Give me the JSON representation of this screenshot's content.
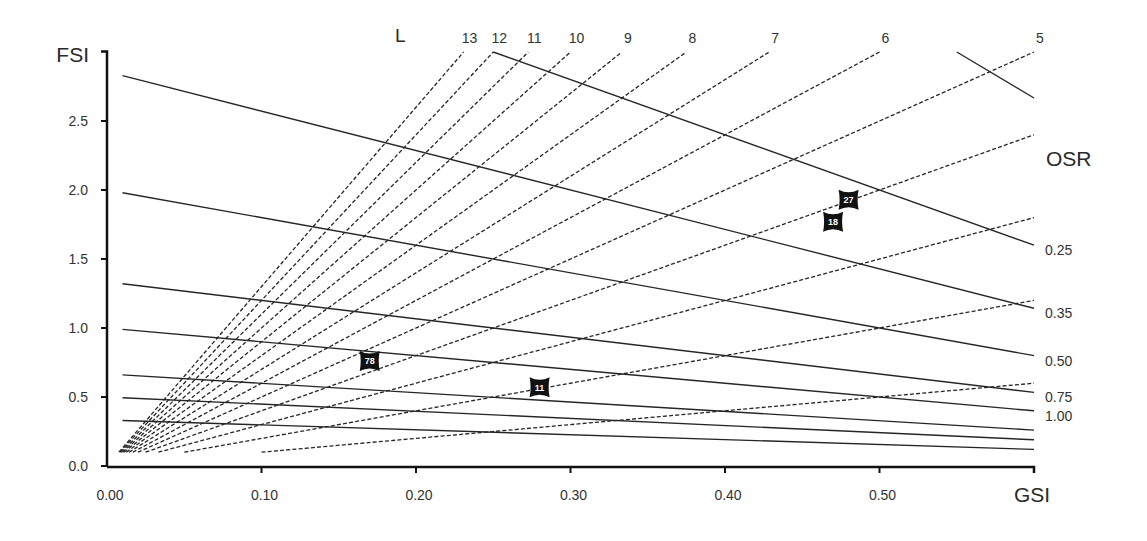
{
  "colors": {
    "background": "#ffffff",
    "line": "#262626",
    "axis": "#111111",
    "text": "#333333",
    "marker": "#111111",
    "marker_text": "#ffffff"
  },
  "chart_data": {
    "type": "line",
    "title": "",
    "xlabel": "GSI",
    "ylabel": "FSI",
    "xlim": [
      0,
      0.6
    ],
    "ylim": [
      0,
      3.0
    ],
    "grid": false,
    "legend": "none (lines labeled directly: L at top, OSR at right)",
    "x_ticks": [
      0,
      0.1,
      0.2,
      0.3,
      0.4,
      0.5
    ],
    "x_tick_labels": [
      "0.00",
      "0.10",
      "0.20",
      "0.30",
      "0.40",
      "0.50"
    ],
    "y_ticks": [
      0,
      0.5,
      1.0,
      1.5,
      2.0,
      2.5
    ],
    "y_tick_labels": [
      "0.0",
      "0.5",
      "1.0",
      "1.5",
      "2.0",
      "2.5"
    ],
    "layer_lines": {
      "title": "L",
      "style": "dashed",
      "series": [
        {
          "name": "L=1",
          "label": "",
          "points": [
            [
              0.1,
              0.1
            ],
            [
              0.6,
              0.6
            ]
          ]
        },
        {
          "name": "L=2",
          "label": "",
          "points": [
            [
              0.05,
              0.1
            ],
            [
              0.6,
              1.2
            ]
          ]
        },
        {
          "name": "L=3",
          "label": "",
          "points": [
            [
              0.0333,
              0.1
            ],
            [
              0.6,
              1.8
            ]
          ]
        },
        {
          "name": "L=4",
          "label": "",
          "points": [
            [
              0.025,
              0.1
            ],
            [
              0.6,
              2.4
            ]
          ]
        },
        {
          "name": "L=5",
          "label": "5",
          "points": [
            [
              0.02,
              0.1
            ],
            [
              0.6,
              3.0
            ]
          ]
        },
        {
          "name": "L=6",
          "label": "6",
          "points": [
            [
              0.0167,
              0.1
            ],
            [
              0.5,
              3.0
            ]
          ]
        },
        {
          "name": "L=7",
          "label": "7",
          "points": [
            [
              0.0143,
              0.1
            ],
            [
              0.4286,
              3.0
            ]
          ]
        },
        {
          "name": "L=8",
          "label": "8",
          "points": [
            [
              0.0125,
              0.1
            ],
            [
              0.375,
              3.0
            ]
          ]
        },
        {
          "name": "L=9",
          "label": "9",
          "points": [
            [
              0.0111,
              0.1
            ],
            [
              0.3333,
              3.0
            ]
          ]
        },
        {
          "name": "L=10",
          "label": "10",
          "points": [
            [
              0.01,
              0.1
            ],
            [
              0.3,
              3.0
            ]
          ]
        },
        {
          "name": "L=11",
          "label": "11",
          "points": [
            [
              0.0091,
              0.1
            ],
            [
              0.2727,
              3.0
            ]
          ]
        },
        {
          "name": "L=12",
          "label": "12",
          "points": [
            [
              0.0083,
              0.1
            ],
            [
              0.25,
              3.0
            ]
          ]
        },
        {
          "name": "L=13",
          "label": "13",
          "points": [
            [
              0.0077,
              0.1
            ],
            [
              0.2308,
              3.0
            ]
          ]
        }
      ]
    },
    "osr_lines": {
      "title": "OSR",
      "style": "solid",
      "series": [
        {
          "name": "OSR=0.15",
          "label": "",
          "points": [
            [
              0.55,
              3.0
            ],
            [
              0.6,
              2.667
            ]
          ]
        },
        {
          "name": "OSR=0.25",
          "label": "0.25",
          "points": [
            [
              0.25,
              3.0
            ],
            [
              0.6,
              1.6
            ]
          ]
        },
        {
          "name": "OSR=0.35",
          "label": "0.35",
          "points": [
            [
              0.01,
              2.829
            ],
            [
              0.6,
              1.143
            ]
          ]
        },
        {
          "name": "OSR=0.50",
          "label": "0.50",
          "points": [
            [
              0.01,
              1.98
            ],
            [
              0.6,
              0.8
            ]
          ]
        },
        {
          "name": "OSR=0.75",
          "label": "0.75",
          "points": [
            [
              0.01,
              1.32
            ],
            [
              0.6,
              0.533
            ]
          ]
        },
        {
          "name": "OSR=1.00",
          "label": "1.00",
          "points": [
            [
              0.01,
              0.99
            ],
            [
              0.6,
              0.4
            ]
          ]
        },
        {
          "name": "OSR=1.5",
          "label": "",
          "points": [
            [
              0.01,
              0.66
            ],
            [
              0.6,
              0.26
            ]
          ]
        },
        {
          "name": "OSR=2.0",
          "label": "",
          "points": [
            [
              0.01,
              0.495
            ],
            [
              0.6,
              0.19
            ]
          ]
        },
        {
          "name": "OSR=3.0",
          "label": "",
          "points": [
            [
              0.01,
              0.33
            ],
            [
              0.6,
              0.12
            ]
          ]
        }
      ]
    },
    "points": [
      {
        "label": "27",
        "x": 0.48,
        "y": 1.93
      },
      {
        "label": "18",
        "x": 0.47,
        "y": 1.77
      },
      {
        "label": "78",
        "x": 0.17,
        "y": 0.76
      },
      {
        "label": "11",
        "x": 0.28,
        "y": 0.57
      }
    ]
  }
}
